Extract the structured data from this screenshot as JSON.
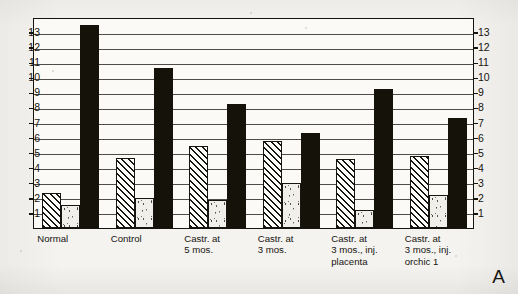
{
  "panel": {
    "letter": "A"
  },
  "chart_data": {
    "type": "bar",
    "title": "",
    "subtitle": "",
    "xlabel": "",
    "ylabel": "",
    "ylim": [
      0,
      14
    ],
    "yticks": [
      1,
      2,
      3,
      4,
      5,
      6,
      7,
      8,
      9,
      10,
      11,
      12,
      13
    ],
    "y_axis_left_labels": [
      13,
      12,
      11,
      10,
      9,
      8,
      7,
      6,
      5,
      4,
      3,
      2,
      1
    ],
    "y_axis_right_labels": [
      13,
      12,
      11,
      10,
      9,
      8,
      7,
      6,
      5,
      4,
      3,
      2,
      1
    ],
    "grid": true,
    "grid_orientation": "horizontal",
    "legend": false,
    "legend_position": "none",
    "categories": [
      "Normal",
      "Control",
      "Castr. at\n5 mos.",
      "Castr. at\n3 mos.",
      "Castr. at\n3 mos., inj.\nplacenta",
      "Castr. at\n3 mos., inj.\norchic 1"
    ],
    "series": [
      {
        "name": "hatched",
        "pattern": "diagonal-hatch",
        "values": [
          2.3,
          4.65,
          5.45,
          5.8,
          4.6,
          4.8
        ]
      },
      {
        "name": "stippled",
        "pattern": "dotted",
        "values": [
          1.5,
          2.0,
          1.85,
          3.0,
          1.2,
          2.2
        ]
      },
      {
        "name": "solid",
        "pattern": "solid-black",
        "values": [
          13.5,
          10.6,
          8.2,
          6.3,
          9.2,
          7.3
        ]
      }
    ],
    "colors": {
      "hatch": "#17150f",
      "dot": "#3a362c",
      "solid": "#141209",
      "frame": "#16140f"
    }
  }
}
